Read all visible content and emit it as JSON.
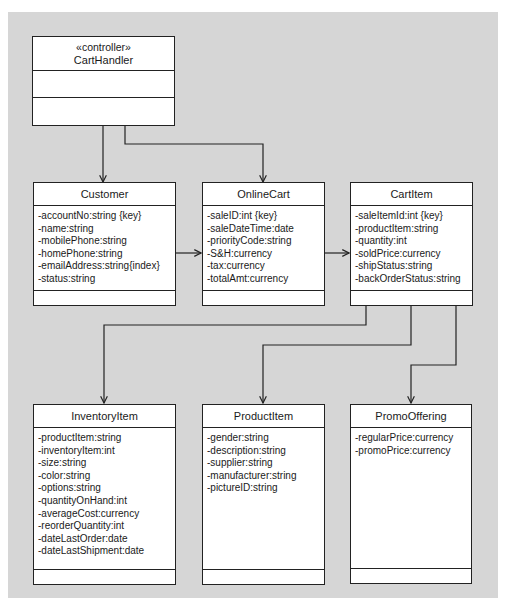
{
  "diagram": {
    "type": "UML class diagram",
    "classes": {
      "cartHandler": {
        "stereotype": "«controller»",
        "name": "CartHandler",
        "attributes": [],
        "operations": []
      },
      "customer": {
        "name": "Customer",
        "attributes": [
          "-accountNo:string {key}",
          "-name:string",
          "-mobilePhone:string",
          "-homePhone:string",
          "-emailAddress:string{index}",
          "-status:string"
        ],
        "operations": []
      },
      "onlineCart": {
        "name": "OnlineCart",
        "attributes": [
          "-saleID:int {key}",
          "-saleDateTime:date",
          "-priorityCode:string",
          "-S&H:currency",
          "-tax:currency",
          "-totalAmt:currency"
        ],
        "operations": []
      },
      "cartItem": {
        "name": "CartItem",
        "attributes": [
          "-saleItemId:int {key}",
          "-productItem:string",
          "-quantity:int",
          "-soldPrice:currency",
          "-shipStatus:string",
          "-backOrderStatus:string"
        ],
        "operations": []
      },
      "inventoryItem": {
        "name": "InventoryItem",
        "attributes": [
          "-productItem:string",
          "-inventoryItem:int",
          "-size:string",
          "-color:string",
          "-options:string",
          "-quantityOnHand:int",
          "-averageCost:currency",
          "-reorderQuantity:int",
          "-dateLastOrder:date",
          "-dateLastShipment:date"
        ],
        "operations": []
      },
      "productItem": {
        "name": "ProductItem",
        "attributes": [
          "-gender:string",
          "-description:string",
          "-supplier:string",
          "-manufacturer:string",
          "-pictureID:string"
        ],
        "operations": []
      },
      "promoOffering": {
        "name": "PromoOffering",
        "attributes": [
          "-regularPrice:currency",
          "-promoPrice:currency"
        ],
        "operations": []
      }
    },
    "associations": [
      {
        "from": "CartHandler",
        "to": "Customer",
        "navigable": true
      },
      {
        "from": "CartHandler",
        "to": "OnlineCart",
        "navigable": true
      },
      {
        "from": "Customer",
        "to": "OnlineCart",
        "navigable": true
      },
      {
        "from": "OnlineCart",
        "to": "CartItem",
        "navigable": true
      },
      {
        "from": "CartItem",
        "to": "InventoryItem",
        "navigable": true
      },
      {
        "from": "CartItem",
        "to": "ProductItem",
        "navigable": true
      },
      {
        "from": "CartItem",
        "to": "PromoOffering",
        "navigable": true
      }
    ],
    "colors": {
      "background": "#d6d6d6",
      "box_fill": "#ffffff",
      "line": "#222222"
    }
  }
}
